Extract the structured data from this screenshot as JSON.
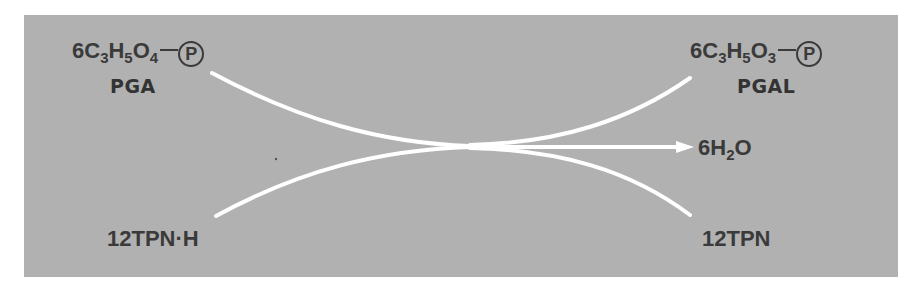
{
  "diagram": {
    "type": "reaction-scheme",
    "colors": {
      "background": "#b1b1b1",
      "arrow": "#ffffff",
      "text": "#3a3a3a"
    },
    "reactants": [
      {
        "formula_parts": [
          "6C",
          "3",
          "H",
          "5",
          "O",
          "4"
        ],
        "phosphate": "P",
        "name": "PGA"
      },
      {
        "formula": "12TPN·H"
      }
    ],
    "products": [
      {
        "formula_parts": [
          "6C",
          "3",
          "H",
          "5",
          "O",
          "3"
        ],
        "phosphate": "P",
        "name": "PGAL"
      },
      {
        "formula_parts": [
          "6H",
          "2",
          "O"
        ]
      },
      {
        "formula": "12TPN"
      }
    ]
  }
}
